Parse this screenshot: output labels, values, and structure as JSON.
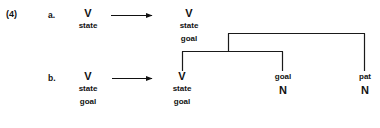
{
  "example": {
    "number": "(4)"
  },
  "lines": [
    {
      "label": "a.",
      "input": {
        "category": "V",
        "features": [
          "state"
        ]
      },
      "output": {
        "category": "V",
        "features": [
          "state",
          "goal"
        ]
      }
    },
    {
      "label": "b.",
      "input": {
        "category": "V",
        "features": [
          "state",
          "goal"
        ]
      },
      "output": {
        "category": "V",
        "features": [
          "state",
          "goal"
        ]
      }
    }
  ],
  "tree": {
    "leaves": [
      {
        "word": "",
        "category": "V",
        "features": [
          "state",
          "goal"
        ]
      },
      {
        "word": "goal",
        "category": "N",
        "features": []
      },
      {
        "word": "pat",
        "category": "N",
        "features": []
      }
    ]
  },
  "arrows": {
    "glyph": "arrow-right",
    "count": 2
  },
  "colors": {
    "background": "#ffffff",
    "ink": "#111111",
    "line": "#1a1a1a"
  }
}
